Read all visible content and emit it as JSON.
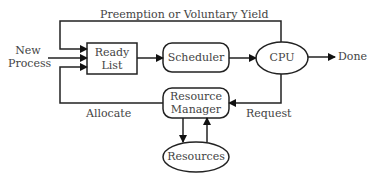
{
  "diagram": {
    "type": "process-scheduling-flow",
    "nodes": {
      "new_process": "New\nProcess",
      "new_process_line1": "New",
      "new_process_line2": "Process",
      "ready_list_line1": "Ready",
      "ready_list_line2": "List",
      "scheduler": "Scheduler",
      "cpu": "CPU",
      "done": "Done",
      "resource_manager_line1": "Resource",
      "resource_manager_line2": "Manager",
      "resources": "Resources"
    },
    "edges": {
      "preemption": "Preemption or Voluntary Yield",
      "allocate": "Allocate",
      "request": "Request"
    },
    "colors": {
      "stroke": "#222222",
      "text": "#444444",
      "background": "#ffffff"
    }
  }
}
